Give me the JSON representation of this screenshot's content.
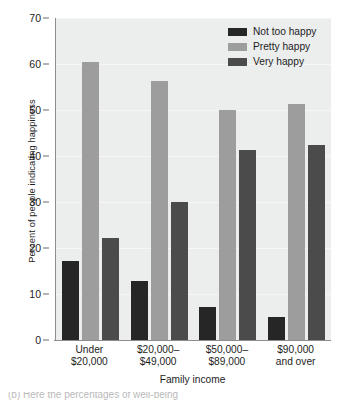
{
  "chart_data": {
    "type": "bar",
    "title": "",
    "subtitle": "",
    "xlabel": "Family income",
    "ylabel": "Percent of people indicating happiness",
    "categories": [
      "Under $20,000",
      "$20,000–$49,000",
      "$50,000–$89,000",
      "$90,000 and over"
    ],
    "category_lines": [
      [
        "Under",
        "$20,000"
      ],
      [
        "$20,000–",
        "$49,000"
      ],
      [
        "$50,000–",
        "$89,000"
      ],
      [
        "$90,000",
        "and over"
      ]
    ],
    "series": [
      {
        "name": "Not too happy",
        "color": "#262626",
        "values": [
          17.2,
          12.8,
          7.2,
          5.0
        ]
      },
      {
        "name": "Pretty happy",
        "color": "#9d9d9d",
        "values": [
          60.4,
          56.4,
          49.9,
          51.3
        ]
      },
      {
        "name": "Very happy",
        "color": "#4b4b4b",
        "values": [
          22.1,
          30.0,
          41.3,
          42.3
        ]
      }
    ],
    "ylim": [
      0,
      70
    ],
    "yticks": [
      0,
      10,
      20,
      30,
      40,
      50,
      60,
      70
    ],
    "ytick_labels": [
      "0",
      "10",
      "20",
      "30",
      "40",
      "50",
      "60",
      "70"
    ],
    "grid": true,
    "grid_axis": "y",
    "legend_position": "top-right",
    "plot_background": "#eceded",
    "axis_color": "#8d8d8d"
  },
  "legend": {
    "entries": [
      {
        "label": "Not too happy"
      },
      {
        "label": "Pretty happy"
      },
      {
        "label": "Very happy"
      }
    ]
  },
  "caption": {
    "partial_text": "(b) Here the percentages of well-being"
  }
}
